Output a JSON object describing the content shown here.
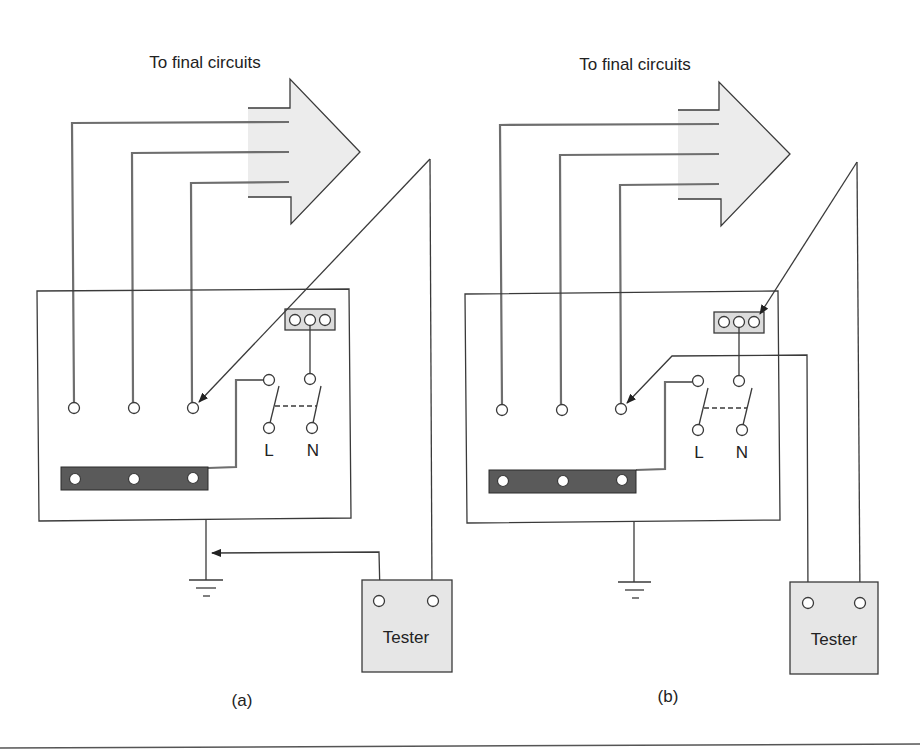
{
  "figure": {
    "panels": [
      {
        "id": "a",
        "caption": "(a)",
        "title": "To final circuits",
        "switch_labels": {
          "live": "L",
          "neutral": "N"
        },
        "tester_label": "Tester"
      },
      {
        "id": "b",
        "caption": "(b)",
        "title": "To final circuits",
        "switch_labels": {
          "live": "L",
          "neutral": "N"
        },
        "tester_label": "Tester"
      }
    ],
    "colors": {
      "line": "#3a3a3a",
      "wire": "#6e6e6e",
      "arrow_fill": "#ececec",
      "terminal_block_fill": "#dcdcdc",
      "neutral_bar_fill": "#5a5a5a",
      "tester_fill": "#e6e6e6",
      "background": "#ffffff"
    }
  }
}
